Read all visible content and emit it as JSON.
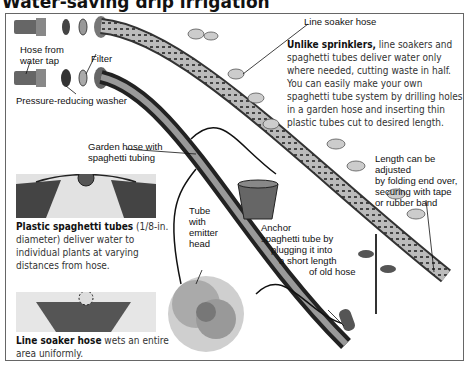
{
  "title": "Water-saving drip irrigation",
  "labels": {
    "line_soaker_hose": "Line soaker hose",
    "hose_from_tap_1": "Hose from",
    "hose_from_tap_2": "water tap",
    "filter": "Filter",
    "pressure_washer": "Pressure-reducing washer",
    "garden_hose_1": "Garden hose with",
    "garden_hose_2": "spaghetti tubing",
    "tube_emitter": [
      "Tube",
      "with",
      "emitter",
      "head"
    ],
    "anchor": [
      "Anchor",
      "spaghetti tube by",
      "plugging it into",
      "a short length",
      "of old hose"
    ],
    "length_adjust": [
      "Length can be adjusted",
      "by folding end over,",
      "securing with tape",
      "or rubber band"
    ]
  },
  "intro": {
    "bold": "Unlike sprinklers,",
    "text": " line soakers and spaghetti tubes deliver water only where needed, cutting waste in half. You can easily make your own spaghetti tube system by drilling holes in a garden hose and inserting thin plastic tubes cut to desired length."
  },
  "captions": {
    "spaghetti": {
      "bold": "Plastic spaghetti tubes",
      "text": " (1/8-in. diameter) deliver water to individual plants at varying distances from hose."
    },
    "soaker": {
      "bold": "Line soaker hose",
      "text": " wets an entire area uniformly."
    }
  },
  "colors": {
    "frame": "#666666",
    "ink": "#111111",
    "soil_dark": "#555555",
    "soil_light": "#d8d8d8"
  }
}
